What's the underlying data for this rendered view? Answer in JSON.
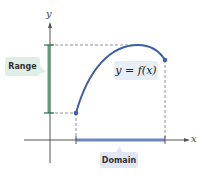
{
  "labels": {
    "range": "Range",
    "domain": "Domain",
    "function": "y = f(x)",
    "x_axis": "x",
    "y_axis": "y"
  },
  "colors": {
    "curve": "#3d5fa8",
    "range_bar": "#5a9e78",
    "domain_bar": "#6b86c2",
    "axis": "#555555"
  }
}
